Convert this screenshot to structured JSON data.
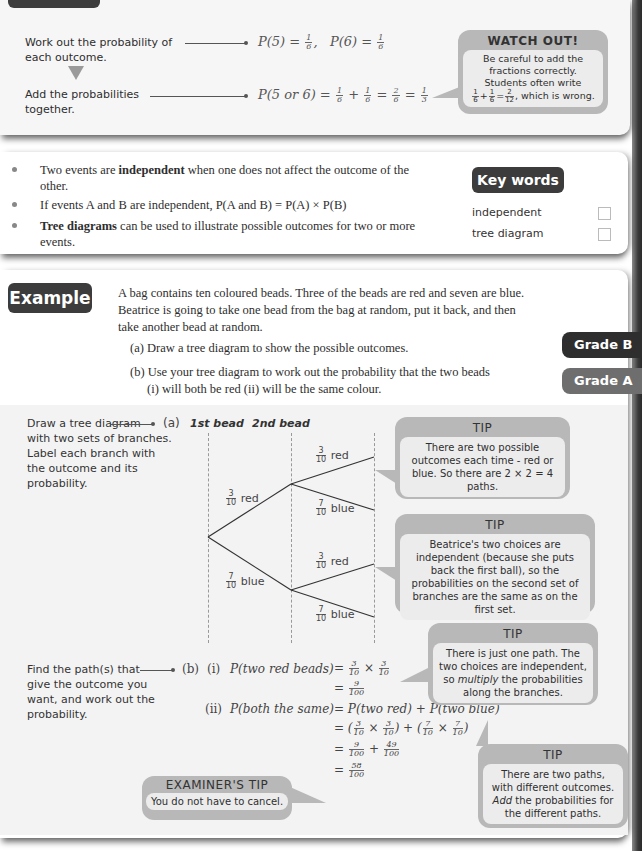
{
  "method_panel": {
    "steps": [
      {
        "text": "Work out the probability of each outcome.",
        "working": "P(5) = 1/6,  P(6) = 1/6"
      },
      {
        "text": "Add the probabilities together.",
        "working": "P(5 or 6) = 1/6 + 1/6 = 2/6 = 1/3"
      }
    ],
    "watch_out": {
      "title": "WATCH OUT!",
      "line1": "Be careful to add the",
      "line2": "fractions correctly.",
      "line3": "Students often write",
      "line4_suffix": ", which is wrong.",
      "wrong_example": "1/6 + 1/6 = 2/12"
    }
  },
  "facts_panel": {
    "bullets": [
      {
        "pre": "Two events are ",
        "bold": "independent",
        "post": " when one does not affect the outcome of the other."
      },
      {
        "pre": "If events A and B are independent,   P(A and B) = P(A) × P(B)",
        "bold": "",
        "post": ""
      },
      {
        "pre": "",
        "bold": "Tree diagrams",
        "post": " can be used to illustrate possible outcomes for two or more events."
      }
    ],
    "key_words": {
      "title": "Key words",
      "items": [
        "independent",
        "tree diagram"
      ]
    }
  },
  "example": {
    "badge": "Example",
    "question_lines": [
      "A bag contains ten coloured beads. Three of the beads are red and seven are blue.",
      "Beatrice is going to take one bead from the bag at random, put it back, and then",
      "take another bead at random."
    ],
    "part_a": "(a)  Draw a tree diagram to show the possible outcomes.",
    "part_b": "(b)  Use your tree diagram to work out the probability that the two beads",
    "part_b_sub": "(i)  will both be red        (ii)  will be the same colour.",
    "grades": [
      {
        "label": "Grade B",
        "color": "#2e2e2e"
      },
      {
        "label": "Grade A",
        "color": "#6e6e6e"
      }
    ]
  },
  "solution": {
    "guide_a": [
      "Draw a tree diagram",
      "with two sets of branches.",
      "Label each branch with",
      "the outcome and its",
      "probability."
    ],
    "guide_b": [
      "Find the path(s) that",
      "give the outcome you",
      "want, and work out the",
      "probability."
    ],
    "part_a_label": "(a)",
    "part_b_label": "(b)",
    "tree": {
      "col1": "1st bead",
      "col2": "2nd bead",
      "first": [
        {
          "num": "3",
          "den": "10",
          "outcome": "red"
        },
        {
          "num": "7",
          "den": "10",
          "outcome": "blue"
        }
      ],
      "second": [
        {
          "num": "3",
          "den": "10",
          "outcome": "red"
        },
        {
          "num": "7",
          "den": "10",
          "outcome": "blue"
        },
        {
          "num": "3",
          "den": "10",
          "outcome": "red"
        },
        {
          "num": "7",
          "den": "10",
          "outcome": "blue"
        }
      ]
    },
    "b_i": {
      "label": "(i)",
      "lhs": "P(two red beads)",
      "line1": "= 3/10 × 3/10",
      "line2": "= 9/100"
    },
    "b_ii": {
      "label": "(ii)",
      "lhs": "P(both the same)",
      "line1": "= P(two red) + P(two blue)",
      "line2": "= (3/10 × 3/10) + (7/10 × 7/10)",
      "line3": "= 9/100 + 49/100",
      "line4": "= 58/100"
    },
    "tips": [
      {
        "title": "TIP",
        "body": "There are two possible outcomes each time - red or blue. So there are 2 × 2 = 4 paths."
      },
      {
        "title": "TIP",
        "body": "Beatrice's two choices are independent (because she puts back the first ball), so the probabilities on the second set of branches are the same as on the first set."
      },
      {
        "title": "TIP",
        "body_pre": "There is just one path. The two choices are independent, so ",
        "body_em": "multiply",
        "body_post": " the probabilities along the branches."
      },
      {
        "title": "TIP",
        "body_pre": "There are two paths, with different outcomes. ",
        "body_em": "Add",
        "body_post": " the probabilities for the different paths."
      }
    ],
    "examiner_tip": {
      "title": "EXAMINER'S TIP",
      "body": "You do not have to cancel."
    }
  }
}
